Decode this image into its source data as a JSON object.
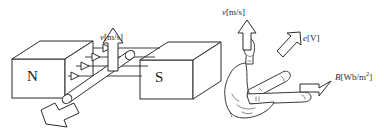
{
  "figure": {
    "name": "electromagnetic-induction-right-hand-rule",
    "background_color": "#ffffff",
    "stroke_color": "#2b2b2b",
    "text_color": "#1a1a1a"
  },
  "magnets": {
    "north": {
      "label": "N"
    },
    "south": {
      "label": "S"
    }
  },
  "labels": {
    "velocity_left": {
      "symbol": "v",
      "unit": "[m/s]"
    },
    "velocity_hand": {
      "symbol": "v",
      "unit": "[m/s]"
    },
    "emf_hand": {
      "symbol": "e",
      "unit": "[V]"
    },
    "flux_density_hand": {
      "symbol": "B",
      "unit_prefix": "[Wb/m",
      "unit_exponent": "2",
      "unit_suffix": "]"
    }
  }
}
